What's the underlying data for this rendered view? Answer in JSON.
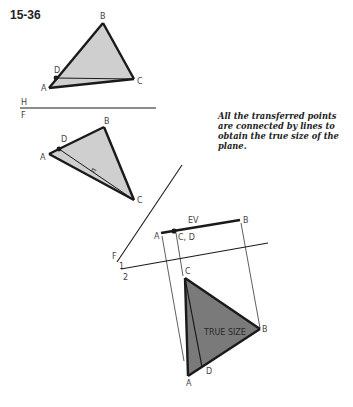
{
  "figure": {
    "number": "15-36",
    "caption": "All the transferred points are connected by lines to obtain the true size of the plane."
  },
  "fold_lines": {
    "hf_top": "H",
    "hf_bottom": "F",
    "f1_top": "F",
    "f1_bottom": "1",
    "twelve": "2"
  },
  "top_view": {
    "labels": {
      "A": "A",
      "B": "B",
      "C": "C",
      "D": "D"
    }
  },
  "front_view": {
    "labels": {
      "A": "A",
      "B": "B",
      "C": "C",
      "D": "D"
    },
    "annotation": "π"
  },
  "edge_view": {
    "label": "EV",
    "labels": {
      "A": "A",
      "B": "B",
      "CD": "C, D"
    }
  },
  "true_size_view": {
    "label": "TRUE SIZE",
    "labels": {
      "A": "A",
      "B": "B",
      "C": "C",
      "D": "D"
    }
  },
  "colors": {
    "line": "#1a1a1a",
    "light_fill": "#cfcfcf",
    "dark_fill": "#7a7a7a",
    "label": "#444444"
  }
}
